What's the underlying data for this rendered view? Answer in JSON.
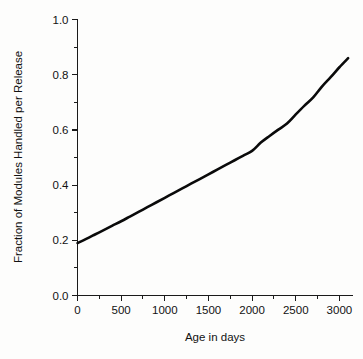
{
  "chart_data": {
    "type": "line",
    "title": "",
    "subtitle": "",
    "xlabel": "Age in days",
    "ylabel": "Fraction of Modules Handled per Release",
    "xlim": [
      0,
      3150
    ],
    "ylim": [
      0.0,
      1.0
    ],
    "grid": false,
    "legend": null,
    "legend_position": "none",
    "x_ticks": [
      0,
      500,
      1000,
      1500,
      2000,
      2500,
      3000
    ],
    "x_tick_labels": [
      "0",
      "500",
      "1000",
      "1500",
      "2000",
      "2500",
      "3000"
    ],
    "x_minor_tick_interval": 250,
    "y_ticks": [
      0.0,
      0.2,
      0.4,
      0.6,
      0.8,
      1.0
    ],
    "y_tick_labels": [
      "0.0",
      "0.2",
      "0.4",
      "0.6",
      "0.8",
      "1.0"
    ],
    "y_minor_tick_interval": 0.1,
    "series": [
      {
        "name": "Fraction of modules handled per release",
        "color": "#0a0a0a",
        "x": [
          0,
          100,
          200,
          300,
          400,
          500,
          600,
          700,
          800,
          900,
          1000,
          1100,
          1200,
          1300,
          1400,
          1500,
          1600,
          1700,
          1800,
          1900,
          2000,
          2100,
          2200,
          2300,
          2400,
          2500,
          2600,
          2700,
          2800,
          2900,
          3000,
          3100
        ],
        "y": [
          0.19,
          0.205,
          0.221,
          0.237,
          0.253,
          0.269,
          0.286,
          0.303,
          0.32,
          0.337,
          0.354,
          0.371,
          0.388,
          0.405,
          0.422,
          0.439,
          0.456,
          0.473,
          0.49,
          0.507,
          0.524,
          0.554,
          0.578,
          0.601,
          0.623,
          0.656,
          0.688,
          0.718,
          0.757,
          0.791,
          0.827,
          0.86
        ]
      }
    ],
    "annotations": []
  },
  "figure": {
    "background_color": "#fdfdfc",
    "axis_color": "#1a1a1a",
    "curve_color": "#0a0a0a"
  }
}
